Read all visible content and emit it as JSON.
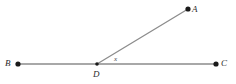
{
  "figure": {
    "kind": "geometry-angle-diagram",
    "width": 236,
    "height": 84,
    "background_color": "#ffffff",
    "line_color": "#8c8c8c",
    "ray_color": "#8c8c8c",
    "point_color": "#1a1a1a",
    "label_color": "#2b2b2b",
    "angle_label_color": "#4a4a4a",
    "points": [
      {
        "id": "A",
        "label": "A",
        "x": 188,
        "y": 9
      },
      {
        "id": "B",
        "label": "B",
        "x": 18,
        "y": 64
      },
      {
        "id": "C",
        "label": "C",
        "x": 216,
        "y": 64
      },
      {
        "id": "D",
        "label": "D",
        "x": 97,
        "y": 64
      }
    ],
    "segments": [
      {
        "id": "BC",
        "from": "B",
        "to": "C"
      },
      {
        "id": "DA",
        "from": "D",
        "to": "A"
      }
    ],
    "angle": {
      "id": "ADC",
      "label": "x",
      "vertex": "D",
      "ray1": "A",
      "ray2": "C"
    }
  },
  "labels": {
    "A": "A",
    "B": "B",
    "C": "C",
    "D": "D",
    "x": "x"
  }
}
